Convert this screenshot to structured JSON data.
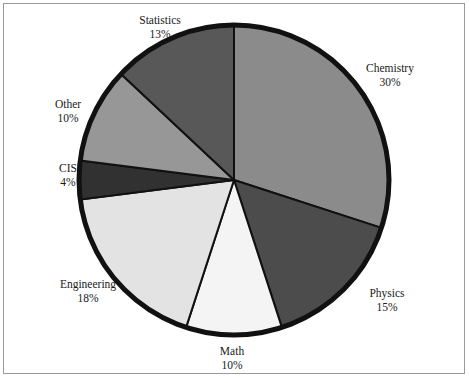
{
  "figure": {
    "name": "pie-chart-figure",
    "frame_color": "#9a9a9a",
    "background": "#ffffff"
  },
  "chart_data": {
    "type": "pie",
    "title": "",
    "subtitle": "",
    "xlabel": "",
    "ylabel": "",
    "legend_position": "none",
    "grid": false,
    "label_format": "name + percent",
    "start_angle_deg": 0,
    "direction": "clockwise",
    "total_percent": 100,
    "outline_color": "#111111",
    "outline_width_px": 5,
    "categories": [
      "Chemistry",
      "Physics",
      "Math",
      "Engineering",
      "CIS",
      "Other",
      "Statistics"
    ],
    "values": [
      30,
      15,
      10,
      18,
      4,
      10,
      13
    ],
    "slices": [
      {
        "name": "Chemistry",
        "percent": 30,
        "label": "Chemistry",
        "value_label": "30%",
        "color": "#8b8b8b",
        "label_x": 390,
        "label_y": 72
      },
      {
        "name": "Physics",
        "percent": 15,
        "label": "Physics",
        "value_label": "15%",
        "color": "#4c4c4c",
        "label_x": 387,
        "label_y": 297
      },
      {
        "name": "Math",
        "percent": 10,
        "label": "Math",
        "value_label": "10%",
        "color": "#f4f4f4",
        "label_x": 232,
        "label_y": 355
      },
      {
        "name": "Engineering",
        "percent": 18,
        "label": "Engineering",
        "value_label": "18%",
        "color": "#e3e3e3",
        "label_x": 88,
        "label_y": 288
      },
      {
        "name": "CIS",
        "percent": 4,
        "label": "CIS",
        "value_label": "4%",
        "color": "#313131",
        "label_x": 68,
        "label_y": 172
      },
      {
        "name": "Other",
        "percent": 10,
        "label": "Other",
        "value_label": "10%",
        "color": "#979797",
        "label_x": 68,
        "label_y": 108
      },
      {
        "name": "Statistics",
        "percent": 13,
        "label": "Statistics",
        "value_label": "13%",
        "color": "#585858",
        "label_x": 160,
        "label_y": 24
      }
    ]
  }
}
